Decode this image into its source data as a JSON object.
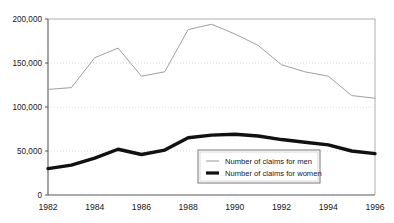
{
  "page": {
    "top_cropped_text": ""
  },
  "chart_data": {
    "type": "line",
    "title": "",
    "xlabel": "",
    "ylabel": "",
    "x": [
      1982,
      1983,
      1984,
      1985,
      1986,
      1987,
      1988,
      1989,
      1990,
      1991,
      1992,
      1993,
      1994,
      1995,
      1996
    ],
    "xlim": [
      1982,
      1996
    ],
    "ylim": [
      0,
      200000
    ],
    "grid": true,
    "grid_values": [
      50000,
      100000,
      150000
    ],
    "legend_position": "inside-bottom-center",
    "series": [
      {
        "name": "Number of claims for men",
        "style": "thin",
        "color": "#8d8d93",
        "values": [
          120000,
          122000,
          156000,
          167000,
          135000,
          140000,
          188000,
          194000,
          183000,
          170000,
          148000,
          140000,
          135000,
          113000,
          110000
        ]
      },
      {
        "name": "Number of claims for women",
        "style": "thick",
        "color": "#111111",
        "values": [
          30000,
          34000,
          42000,
          52000,
          46000,
          51000,
          65000,
          68000,
          69000,
          67000,
          63000,
          60000,
          57000,
          50000,
          47000
        ]
      }
    ],
    "y_ticks": [
      {
        "value": 0,
        "label": "0"
      },
      {
        "value": 50000,
        "label": "50,000"
      },
      {
        "value": 100000,
        "label": "100,000"
      },
      {
        "value": 150000,
        "label": "150,000"
      },
      {
        "value": 200000,
        "label": "200,000"
      }
    ],
    "x_ticks": [
      {
        "value": 1982,
        "label": "1982"
      },
      {
        "value": 1984,
        "label": "1984"
      },
      {
        "value": 1986,
        "label": "1986"
      },
      {
        "value": 1988,
        "label": "1988"
      },
      {
        "value": 1990,
        "label": "1990"
      },
      {
        "value": 1992,
        "label": "1992"
      },
      {
        "value": 1994,
        "label": "1994"
      },
      {
        "value": 1996,
        "label": "1996"
      }
    ],
    "legend_entries": [
      {
        "label": "Number of claims for men",
        "style": "thin"
      },
      {
        "label": "Number of claims for women",
        "style": "thick"
      }
    ],
    "colors": {
      "axis": "#5a5a60",
      "grid": "#e3d3d6",
      "men_line": "#8d8d93",
      "women_line": "#111111",
      "legend_border": "#77777d",
      "background": "#ffffff"
    }
  }
}
